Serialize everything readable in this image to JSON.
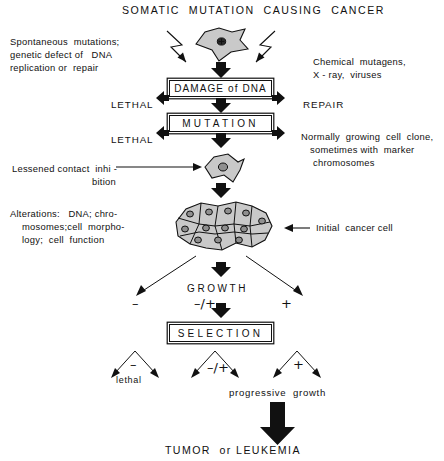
{
  "diagram": {
    "title": "SOMATIC  MUTATION  CAUSING  CANCER",
    "left_annotations": {
      "spontaneous": {
        "line1": "Spontaneous  mutations;",
        "line2": "genetic defect of   DNA",
        "line3": "replication or  repair"
      },
      "contact_inhibition": {
        "line1": "Lessened contact  inhi -",
        "line2": "bition"
      },
      "alterations": {
        "line1": "Alterations:   DNA; chro-",
        "line2": "mosomes;cell  morpho-",
        "line3": "logy;  cell  function"
      }
    },
    "right_annotations": {
      "mutagens": {
        "line1": "Chemical  mutagens,",
        "line2": "X - ray,  viruses"
      },
      "clone": {
        "line1": "Normally  growing  cell  clone,",
        "line2": "sometimes with  marker",
        "line3": "chromosomes"
      },
      "initial_cancer_cell": "Initial  cancer cell"
    },
    "boxes": {
      "damage": "DAMAGE  of   DNA",
      "mutation": "MUTATION",
      "selection": "SELECTION"
    },
    "side_labels": {
      "lethal_damage": "LETHAL",
      "repair": "REPAIR",
      "lethal_mutation": "LETHAL"
    },
    "growth": {
      "label": "GROWTH",
      "sign_minus": "–",
      "sign_mixed": "–/+",
      "sign_plus": "+"
    },
    "outcomes": {
      "branch_left_sign": "–",
      "branch_left_label": "lethal",
      "branch_mid_sign": "–/+",
      "branch_right_sign": "+",
      "progressive_growth": "progressive  growth",
      "final": "TUMOR  or LEUKEMIA"
    },
    "cells": {
      "top_cell_name": "fibroblast-cell-shape",
      "mid_cell_name": "transformed-cell-shape",
      "cluster_name": "cancer-cell-cluster",
      "cluster_cell_count": 10,
      "fill_color": "#c9c9c9",
      "outline_color": "#111111"
    }
  }
}
